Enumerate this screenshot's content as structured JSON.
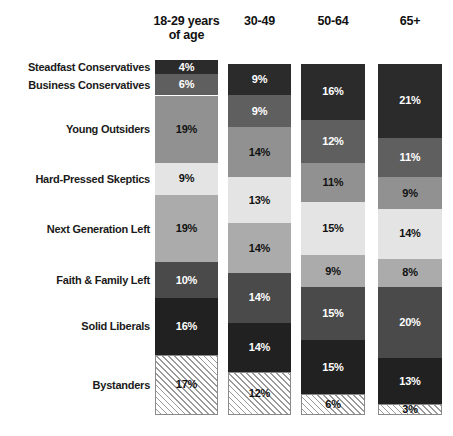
{
  "chart_data": {
    "type": "bar",
    "subtype": "stacked-bar-100-percent",
    "title": "",
    "xlabel": "",
    "ylabel": "",
    "orientation": "vertical",
    "stacked": true,
    "grid": false,
    "legend": "row-labels-left",
    "value_suffix": "%",
    "ylim": [
      0,
      100
    ],
    "categories": [
      "18-29 years of age",
      "30-49",
      "50-64",
      "65+"
    ],
    "category_labels_short": [
      "18-29",
      "30-49",
      "50-64",
      "65+"
    ],
    "series": [
      {
        "name": "Steadfast Conservatives",
        "values": [
          4,
          9,
          16,
          21
        ]
      },
      {
        "name": "Business Conservatives",
        "values": [
          6,
          9,
          12,
          11
        ]
      },
      {
        "name": "Young Outsiders",
        "values": [
          19,
          14,
          11,
          9
        ]
      },
      {
        "name": "Hard-Pressed Skeptics",
        "values": [
          9,
          13,
          15,
          14
        ]
      },
      {
        "name": "Next Generation Left",
        "values": [
          19,
          14,
          9,
          8
        ]
      },
      {
        "name": "Faith & Family Left",
        "values": [
          10,
          14,
          15,
          20
        ]
      },
      {
        "name": "Solid Liberals",
        "values": [
          16,
          14,
          15,
          13
        ]
      },
      {
        "name": "Bystanders",
        "values": [
          17,
          12,
          6,
          3
        ]
      }
    ],
    "series_colors": [
      "#2b2b2b",
      "#5f5f5f",
      "#919191",
      "#e4e4e4",
      "#ababab",
      "#4a4a4a",
      "#212121",
      "#ffffff"
    ],
    "series_label_colors": [
      "#ffffff",
      "#ffffff",
      "#111111",
      "#111111",
      "#111111",
      "#ffffff",
      "#ffffff",
      "#111111"
    ],
    "series_patterns": [
      "solid",
      "solid",
      "solid",
      "solid",
      "solid",
      "solid",
      "solid",
      "diagonal-hatch"
    ]
  },
  "header": {
    "columns": [
      {
        "line1": "18-29 years",
        "line2": "of age"
      },
      {
        "line1": "30-49",
        "line2": ""
      },
      {
        "line1": "50-64",
        "line2": ""
      },
      {
        "line1": "65+",
        "line2": ""
      }
    ]
  },
  "row_labels": [
    "Steadfast Conservatives",
    "Business Conservatives",
    "Young Outsiders",
    "Hard-Pressed Skeptics",
    "Next Generation Left",
    "Faith & Family Left",
    "Solid Liberals",
    "Bystanders"
  ],
  "bars": [
    {
      "category": "18-29 years of age",
      "segments": [
        {
          "label": "4%",
          "value": 4
        },
        {
          "label": "6%",
          "value": 6
        },
        {
          "label": "19%",
          "value": 19
        },
        {
          "label": "9%",
          "value": 9
        },
        {
          "label": "19%",
          "value": 19
        },
        {
          "label": "10%",
          "value": 10
        },
        {
          "label": "16%",
          "value": 16
        },
        {
          "label": "17%",
          "value": 17
        }
      ]
    },
    {
      "category": "30-49",
      "segments": [
        {
          "label": "9%",
          "value": 9
        },
        {
          "label": "9%",
          "value": 9
        },
        {
          "label": "14%",
          "value": 14
        },
        {
          "label": "13%",
          "value": 13
        },
        {
          "label": "14%",
          "value": 14
        },
        {
          "label": "14%",
          "value": 14
        },
        {
          "label": "14%",
          "value": 14
        },
        {
          "label": "12%",
          "value": 12
        }
      ]
    },
    {
      "category": "50-64",
      "segments": [
        {
          "label": "16%",
          "value": 16
        },
        {
          "label": "12%",
          "value": 12
        },
        {
          "label": "11%",
          "value": 11
        },
        {
          "label": "15%",
          "value": 15
        },
        {
          "label": "9%",
          "value": 9
        },
        {
          "label": "15%",
          "value": 15
        },
        {
          "label": "15%",
          "value": 15
        },
        {
          "label": "6%",
          "value": 6
        }
      ]
    },
    {
      "category": "65+",
      "segments": [
        {
          "label": "21%",
          "value": 21
        },
        {
          "label": "11%",
          "value": 11
        },
        {
          "label": "9%",
          "value": 9
        },
        {
          "label": "14%",
          "value": 14
        },
        {
          "label": "8%",
          "value": 8
        },
        {
          "label": "20%",
          "value": 20
        },
        {
          "label": "13%",
          "value": 13
        },
        {
          "label": "3%",
          "value": 3
        }
      ]
    }
  ]
}
